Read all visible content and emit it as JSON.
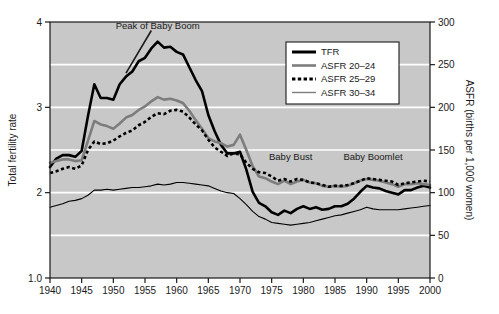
{
  "chart_data": {
    "type": "line",
    "title": "",
    "xlabel": "",
    "ylabel": "Total fertility rate",
    "y2label": "ASFR (births per 1,000 women)",
    "grid": true,
    "legend_position": "top-right",
    "xlim": [
      1940,
      2000
    ],
    "ylim": [
      1.0,
      4.0
    ],
    "y2lim": [
      0,
      300
    ],
    "xticks": [
      1940,
      1945,
      1950,
      1955,
      1960,
      1965,
      1970,
      1975,
      1980,
      1985,
      1990,
      1995,
      2000
    ],
    "xticklabels": [
      "1940",
      "1945",
      "1950",
      "1955",
      "1960",
      "1965",
      "1970",
      "1975",
      "1980",
      "1985",
      "1990",
      "1995",
      "2000"
    ],
    "yticks": [
      1.0,
      2,
      3,
      4
    ],
    "yticklabels": [
      "1.0",
      "2",
      "3",
      "4"
    ],
    "y2ticks": [
      0,
      50,
      100,
      150,
      200,
      250,
      300
    ],
    "y2ticklabels": [
      "0",
      "50",
      "100",
      "150",
      "200",
      "250",
      "300"
    ],
    "x": [
      1940,
      1941,
      1942,
      1943,
      1944,
      1945,
      1946,
      1947,
      1948,
      1949,
      1950,
      1951,
      1952,
      1953,
      1954,
      1955,
      1956,
      1957,
      1958,
      1959,
      1960,
      1961,
      1962,
      1963,
      1964,
      1965,
      1966,
      1967,
      1968,
      1969,
      1970,
      1971,
      1972,
      1973,
      1974,
      1975,
      1976,
      1977,
      1978,
      1979,
      1980,
      1981,
      1982,
      1983,
      1984,
      1985,
      1986,
      1987,
      1988,
      1989,
      1990,
      1991,
      1992,
      1993,
      1994,
      1995,
      1996,
      1997,
      1998,
      1999,
      2000
    ],
    "series": [
      {
        "name": "TFR",
        "axis": "left",
        "color": "#000000",
        "style": "solid-thick",
        "values": [
          2.3,
          2.4,
          2.44,
          2.44,
          2.42,
          2.49,
          2.9,
          3.27,
          3.11,
          3.11,
          3.09,
          3.27,
          3.36,
          3.42,
          3.54,
          3.58,
          3.69,
          3.77,
          3.7,
          3.71,
          3.65,
          3.62,
          3.47,
          3.32,
          3.19,
          2.91,
          2.72,
          2.56,
          2.46,
          2.46,
          2.48,
          2.27,
          2.01,
          1.88,
          1.84,
          1.77,
          1.74,
          1.79,
          1.76,
          1.81,
          1.84,
          1.81,
          1.83,
          1.8,
          1.81,
          1.84,
          1.84,
          1.87,
          1.93,
          2.01,
          2.08,
          2.06,
          2.05,
          2.02,
          2.0,
          1.98,
          2.03,
          2.03,
          2.06,
          2.08,
          2.06
        ]
      },
      {
        "name": "ASFR 20–24",
        "axis": "right",
        "color": "#7d7d7d",
        "style": "solid-thick",
        "values": [
          135,
          137,
          139,
          139,
          137,
          138,
          161,
          184,
          180,
          178,
          175,
          181,
          188,
          191,
          197,
          201,
          207,
          212,
          209,
          210,
          208,
          205,
          196,
          185,
          175,
          164,
          160,
          158,
          154,
          156,
          168,
          150,
          131,
          119,
          117,
          113,
          110,
          114,
          110,
          113,
          115,
          112,
          111,
          108,
          107,
          108,
          107,
          108,
          111,
          114,
          116,
          115,
          114,
          112,
          110,
          107,
          110,
          110,
          111,
          110,
          109
        ]
      },
      {
        "name": "ASFR 25–29",
        "axis": "right",
        "color": "#000000",
        "style": "dotted",
        "values": [
          123,
          125,
          128,
          130,
          128,
          132,
          150,
          160,
          157,
          158,
          161,
          166,
          170,
          173,
          179,
          183,
          189,
          193,
          192,
          196,
          197,
          195,
          188,
          180,
          173,
          162,
          153,
          148,
          143,
          146,
          145,
          135,
          128,
          124,
          123,
          119,
          114,
          116,
          113,
          116,
          115,
          112,
          111,
          109,
          107,
          108,
          108,
          109,
          111,
          114,
          117,
          116,
          115,
          114,
          113,
          109,
          111,
          112,
          113,
          114,
          113
        ]
      },
      {
        "name": "ASFR 30–34",
        "axis": "right",
        "color": "#000000",
        "style": "solid-thin",
        "values": [
          83,
          85,
          87,
          90,
          91,
          93,
          97,
          103,
          103,
          104,
          103,
          104,
          105,
          106,
          106,
          107,
          108,
          110,
          109,
          110,
          112,
          112,
          111,
          110,
          109,
          108,
          105,
          102,
          100,
          99,
          93,
          86,
          78,
          72,
          69,
          65,
          64,
          63,
          62,
          63,
          64,
          65,
          67,
          69,
          71,
          73,
          74,
          76,
          78,
          80,
          83,
          81,
          80,
          80,
          80,
          80,
          81,
          82,
          83,
          84,
          85
        ]
      }
    ],
    "annotations": [
      {
        "text": "Peak of Baby Boom",
        "x": 1957,
        "y": 3.95
      },
      {
        "text": "Baby Bust",
        "x": 1978,
        "y": 2.42
      },
      {
        "text": "Baby Boomlet",
        "x": 1991,
        "y": 2.42
      }
    ]
  },
  "legend": {
    "entries": [
      {
        "label": "TFR",
        "swatch": "solid-thick-black"
      },
      {
        "label": "ASFR 20–24",
        "swatch": "solid-thick-gray"
      },
      {
        "label": "ASFR 25–29",
        "swatch": "dotted-black"
      },
      {
        "label": "ASFR 30–34",
        "swatch": "solid-thin-gray"
      }
    ]
  },
  "colors": {
    "plot_background": "#c8c8c8",
    "gridline": "#ffffff",
    "axis": "#1a1a1a",
    "series_dark": "#000000",
    "series_gray": "#7d7d7d",
    "page_background": "#ffffff"
  }
}
